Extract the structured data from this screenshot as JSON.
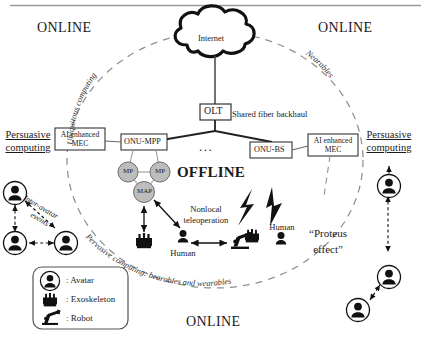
{
  "figure": {
    "regions": {
      "online_top_left": "ONLINE",
      "online_top_right": "ONLINE",
      "online_bottom": "ONLINE",
      "offline": "OFFLINE"
    },
    "arc_labels": {
      "left": "Ubiquitous computing",
      "right": "Nearables",
      "bottom": "Pervasive computing: bearables and wearables"
    },
    "network": {
      "cloud": "Internet",
      "olt": "OLT",
      "backhaul": "Shared fiber backhaul",
      "onu_mpp": "ONU-MPP",
      "onu_bs": "ONU-BS",
      "ellipsis": "...",
      "mec_left": "AI enhanced MEC",
      "mec_left_line1": "AI enhanced",
      "mec_left_line2": "MEC",
      "mec_right_line1": "AI enhanced",
      "mec_right_line2": "MEC",
      "mesh_nodes": [
        "MP",
        "MP",
        "MAP"
      ]
    },
    "side_labels": {
      "persuasive_left_line1": "Persuasive",
      "persuasive_left_line2": "computing",
      "persuasive_right_line1": "Persuasive",
      "persuasive_right_line2": "computing"
    },
    "annotations": {
      "inter_avatar_line1": "Inter-avatar",
      "inter_avatar_line2": "events",
      "nonlocal_line1": "Nonlocal",
      "nonlocal_line2": "teleoperation",
      "human_center": "Human",
      "human_right": "Human",
      "proteus_line1": "“Proteus",
      "proteus_line2": "effect”"
    },
    "legend": {
      "items": [
        {
          "icon": "avatar-icon",
          "label": ": Avatar"
        },
        {
          "icon": "exoskeleton-icon",
          "label": ": Exoskeleton"
        },
        {
          "icon": "robot-icon",
          "label": ": Robot"
        }
      ]
    },
    "colors": {
      "stroke": "#1a1a1a",
      "node_fill": "#b9b9b9",
      "dashed": "#8c8c8c",
      "box_line": "#4d4d4d",
      "rule": "#9a9a9a"
    }
  }
}
